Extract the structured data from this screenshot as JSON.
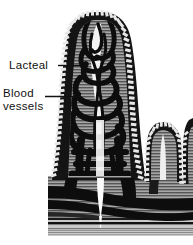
{
  "figure": {
    "background_color": "#ffffff",
    "ink_color": "#111111",
    "tissue_fill_color": "#9a9a9a",
    "vessel_color": "#0d0d0d",
    "lacteal_color": "#f5f5f5",
    "width": 193,
    "height": 245
  },
  "labels": {
    "lacteal": {
      "text": "Lacteal",
      "line1": "Lacteal"
    },
    "blood_vessels": {
      "text": "Blood vessels",
      "line1": "Blood",
      "line2": "vessels"
    }
  },
  "structures": {
    "villus": "main-villus",
    "secondary_villus": "secondary-villus",
    "epithelium": "columnar-epithelium-border",
    "capillary_network": "blood-capillary-network",
    "central_lacteal": "central-lacteal-channel",
    "submucosa": "submucosal-vessel-bands"
  }
}
